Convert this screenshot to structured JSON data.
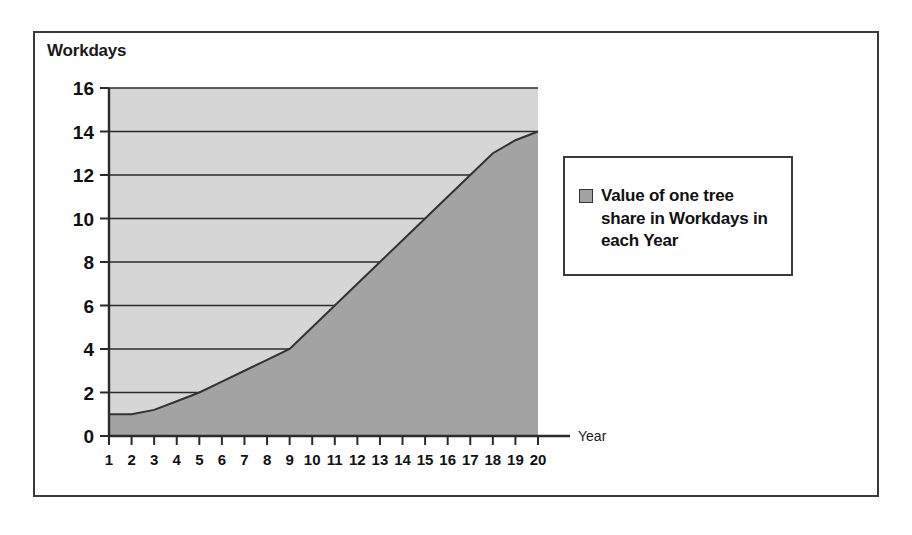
{
  "chart_data": {
    "type": "area",
    "title": "",
    "ylabel": "Workdays",
    "xlabel": "Year",
    "xlim": [
      1,
      20
    ],
    "ylim": [
      0,
      16
    ],
    "ytick_step": 2,
    "grid": true,
    "legend_position": "right",
    "x": [
      1,
      2,
      3,
      4,
      5,
      6,
      7,
      8,
      9,
      10,
      11,
      12,
      13,
      14,
      15,
      16,
      17,
      18,
      19,
      20
    ],
    "xtick_labels": [
      "1",
      "2",
      "3",
      "4",
      "5",
      "6",
      "7",
      "8",
      "9",
      "10",
      "11",
      "12",
      "13",
      "14",
      "15",
      "16",
      "17",
      "18",
      "19",
      "20"
    ],
    "ytick_labels": [
      "0",
      "2",
      "4",
      "6",
      "8",
      "10",
      "12",
      "14",
      "16"
    ],
    "series": [
      {
        "name": "Value of one tree share in Workdays in each Year",
        "values": [
          1,
          1,
          1.2,
          1.6,
          2,
          2.5,
          3,
          3.5,
          4,
          5,
          6,
          7,
          8,
          9,
          10,
          11,
          12,
          13,
          13.6,
          14
        ]
      }
    ],
    "colors": {
      "plot_background": "#d6d6d6",
      "area_fill": "#a3a3a3",
      "line": "#333333",
      "grid": "#2b2b2b",
      "axis": "#2b2b2b",
      "border": "#3a3a3a"
    }
  },
  "legend": {
    "entries": [
      {
        "label": "Value of one tree share in Workdays in each Year",
        "swatch": "legend-swatch-gray"
      }
    ]
  }
}
